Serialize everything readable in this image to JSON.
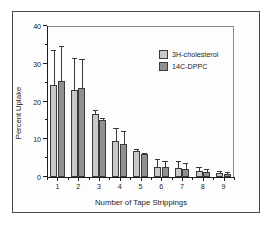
{
  "chart_data": {
    "type": "bar",
    "title": "",
    "subtitle": "",
    "xlabel": "Number of Tape Strippings",
    "ylabel": "Percent Uptake",
    "categories": [
      "1",
      "2",
      "3",
      "4",
      "5",
      "6",
      "7",
      "8",
      "9"
    ],
    "ylim": [
      0,
      40
    ],
    "yticks": [
      0,
      10,
      20,
      30,
      40
    ],
    "ytick_labels": [
      "0",
      "10",
      "20",
      "30",
      "40"
    ],
    "yminor_ticks": [
      5,
      15,
      25,
      35
    ],
    "xlim": [
      0.5,
      9.5
    ],
    "grid": false,
    "legend_position": "upper right",
    "orientation": "vertical",
    "error_bars": "upper-only",
    "series": [
      {
        "name": "3H-cholesterol",
        "color": "#c9c9c9",
        "values": [
          24.5,
          23.0,
          16.7,
          9.6,
          6.8,
          2.7,
          2.5,
          1.7,
          1.0
        ],
        "errors": [
          9.0,
          8.2,
          0.7,
          3.2,
          0.3,
          1.7,
          1.5,
          0.8,
          0.3
        ]
      },
      {
        "name": "14C-DPPC",
        "color": "#909090",
        "values": [
          25.5,
          23.5,
          15.0,
          8.8,
          6.0,
          2.6,
          2.2,
          1.4,
          0.9
        ],
        "errors": [
          9.0,
          7.6,
          0.5,
          3.2,
          0.2,
          1.5,
          1.3,
          0.5,
          0.2
        ]
      }
    ]
  },
  "legend": {
    "items": [
      {
        "label": "3H-cholesterol",
        "swatch": "#c9c9c9"
      },
      {
        "label": "14C-DPPC",
        "swatch": "#909090"
      }
    ]
  }
}
